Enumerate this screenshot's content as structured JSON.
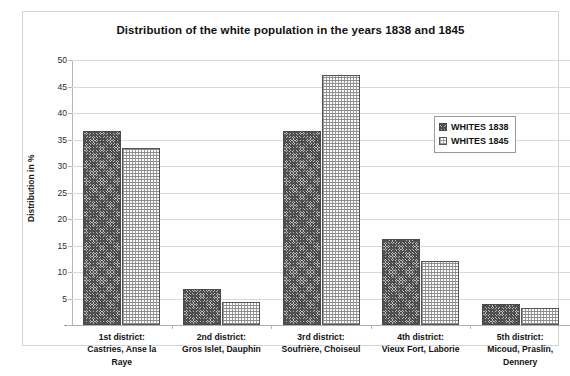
{
  "chart_data": {
    "type": "bar",
    "title": "Distribution of the white population in the years 1838 and 1845",
    "xlabel": "",
    "ylabel": "Distribution in %",
    "ylim": [
      0,
      50
    ],
    "yticks": [
      "-",
      "5",
      "10",
      "15",
      "20",
      "25",
      "30",
      "35",
      "40",
      "45",
      "50"
    ],
    "ytick_values": [
      0,
      5,
      10,
      15,
      20,
      25,
      30,
      35,
      40,
      45,
      50
    ],
    "grid": true,
    "legend_position": "upper right",
    "categories": [
      "1st district: Castries, Anse la Raye",
      "2nd district: Gros Islet, Dauphin",
      "3rd district: Soufrière, Choiseul",
      "4th district: Vieux Fort, Laborie",
      "5th district: Micoud, Praslin, Dennery"
    ],
    "category_lines": [
      [
        "1st district:",
        "Castries, Anse la",
        "Raye"
      ],
      [
        "2nd district:",
        "Gros Islet, Dauphin"
      ],
      [
        "3rd district:",
        "Soufrière, Choiseul"
      ],
      [
        "4th district:",
        "Vieux Fort, Laborie"
      ],
      [
        "5th district:",
        "Micoud, Praslin,",
        "Dennery"
      ]
    ],
    "series": [
      {
        "name": "WHITES 1838",
        "values": [
          36.6,
          6.8,
          36.6,
          16.3,
          3.9
        ]
      },
      {
        "name": "WHITES 1845",
        "values": [
          33.4,
          4.4,
          47.2,
          12.0,
          3.3
        ]
      }
    ]
  },
  "legend": {
    "items": [
      {
        "label": "WHITES 1838",
        "swatch": "hatched-swatch"
      },
      {
        "label": "WHITES 1845",
        "swatch": "dotted-swatch"
      }
    ]
  },
  "colors": {
    "series_1838": "#4c4c4c",
    "series_1845": "#9a9a9a",
    "gridline": "#d9d9d9",
    "axis": "#b6b6b6",
    "frame_border": "#d4d4d4",
    "text": "#121212"
  }
}
